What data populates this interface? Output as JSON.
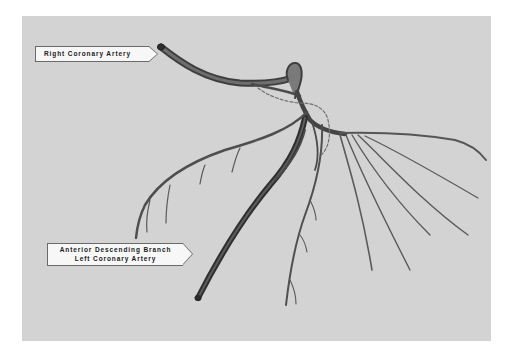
{
  "figure": {
    "background_color": "#ffffff",
    "panel_color": "#d3d3d3",
    "vessel_color": "#5a5a5a",
    "labels": {
      "right_coronary_artery": "Right Coronary Artery",
      "anterior_descending_line1": "Anterior Descending Branch",
      "anterior_descending_line2": "Left Coronary Artery"
    }
  }
}
